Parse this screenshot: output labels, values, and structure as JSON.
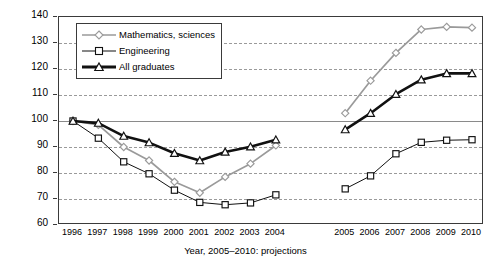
{
  "chart_data": {
    "type": "line",
    "title": "",
    "xlabel": "Year, 2005–2010: projections",
    "ylabel": "No. of graduates, 1996 = 100",
    "categories": [
      "1996",
      "1997",
      "1998",
      "1999",
      "2000",
      "2001",
      "2002",
      "2003",
      "2004",
      "2005",
      "2006",
      "2007",
      "2008",
      "2009",
      "2010"
    ],
    "x_tick_labels": [
      "1996",
      "1997",
      "1998",
      "1999",
      "2000",
      "2001",
      "2002",
      "2003",
      "2004",
      "2005",
      "2006",
      "2007",
      "2008",
      "2009",
      "2010"
    ],
    "y_tick_labels": [
      "60",
      "70",
      "80",
      "90",
      "100",
      "110",
      "120",
      "130",
      "140"
    ],
    "ylim": [
      60,
      140
    ],
    "y_ticks": [
      60,
      70,
      80,
      90,
      100,
      110,
      120,
      130,
      140
    ],
    "grid": "horizontal-dashed",
    "baseline_value": 100,
    "series_break_after": "2004",
    "projection_start": "2005",
    "legend_position": "top-left-inside",
    "series": [
      {
        "name": "Mathematics, sciences",
        "color": "#9a9a9a",
        "marker": "diamond",
        "line_width": 1.7,
        "values": [
          100.0,
          98.5,
          90.0,
          84.8,
          76.6,
          72.4,
          78.5,
          83.6,
          90.6,
          103.0,
          115.5,
          126.2,
          135.2,
          136.2,
          135.9
        ]
      },
      {
        "name": "Engineering",
        "color": "#111111",
        "marker": "square",
        "line_width": 1.0,
        "values": [
          100.0,
          93.4,
          84.3,
          79.7,
          73.4,
          68.7,
          67.8,
          68.5,
          71.6,
          73.9,
          78.9,
          87.4,
          91.8,
          92.6,
          92.8
        ]
      },
      {
        "name": "All graduates",
        "color": "#111111",
        "marker": "triangle",
        "line_width": 2.6,
        "values": [
          100.0,
          99.2,
          94.2,
          91.7,
          87.6,
          84.8,
          88.1,
          90.1,
          92.8,
          96.7,
          103.0,
          110.3,
          115.9,
          118.3,
          118.3
        ]
      }
    ]
  },
  "legend": {
    "items": [
      {
        "label": "Mathematics, sciences"
      },
      {
        "label": "Engineering"
      },
      {
        "label": "All graduates"
      }
    ]
  }
}
